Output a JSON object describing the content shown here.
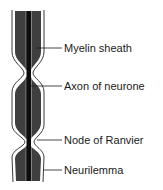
{
  "diagram": {
    "colors": {
      "myelin": "#3f3f3f",
      "axon": "#0d0d0d",
      "neurilemma_outline": "#222222",
      "background": "#ffffff"
    },
    "labels": [
      {
        "id": "myelin-sheath",
        "text": "Myelin sheath",
        "y": 48
      },
      {
        "id": "axon",
        "text": "Axon of neurone",
        "y": 86
      },
      {
        "id": "node-of-ranvier",
        "text": "Node of Ranvier",
        "y": 140
      },
      {
        "id": "neurilemma",
        "text": "Neurilemma",
        "y": 170
      }
    ]
  }
}
